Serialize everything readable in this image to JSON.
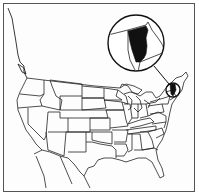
{
  "map": {
    "title": "",
    "subject": "United States map with Vermont highlighted",
    "highlighted_region": "Vermont",
    "inset": {
      "shape": "circle",
      "content": "Enlarged view of Vermont and neighboring borders (New York, New Hampshire, Quebec)",
      "highlight_color": "#111111"
    },
    "colors": {
      "background": "#ffffff",
      "lines": "#222222",
      "highlight": "#111111",
      "frame": "#555555"
    }
  }
}
